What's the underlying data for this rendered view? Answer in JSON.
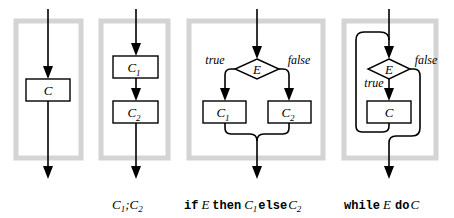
{
  "diagram": {
    "panels": [
      {
        "id": "single",
        "nodes": [
          {
            "type": "command",
            "label": "C",
            "subscript": ""
          }
        ],
        "caption": ""
      },
      {
        "id": "sequence",
        "nodes": [
          {
            "type": "command",
            "label": "C",
            "subscript": "1"
          },
          {
            "type": "command",
            "label": "C",
            "subscript": "2"
          }
        ],
        "caption": {
          "c1": "C",
          "c1_sub": "1",
          "sep": ";",
          "c2": "C",
          "c2_sub": "2"
        }
      },
      {
        "id": "conditional",
        "condition": "E",
        "true_label": "true",
        "false_label": "false",
        "nodes": [
          {
            "type": "command",
            "label": "C",
            "subscript": "1"
          },
          {
            "type": "command",
            "label": "C",
            "subscript": "2"
          }
        ],
        "caption": {
          "kw_if": "if",
          "expr": "E",
          "kw_then": "then",
          "c1": "C",
          "c1_sub": "1",
          "kw_else": "else",
          "c2": "C",
          "c2_sub": "2"
        }
      },
      {
        "id": "while-loop",
        "condition": "E",
        "true_label": "true",
        "false_label": "false",
        "nodes": [
          {
            "type": "command",
            "label": "C",
            "subscript": ""
          }
        ],
        "caption": {
          "kw_while": "while",
          "expr": "E",
          "kw_do": "do",
          "body": "C"
        }
      }
    ]
  }
}
